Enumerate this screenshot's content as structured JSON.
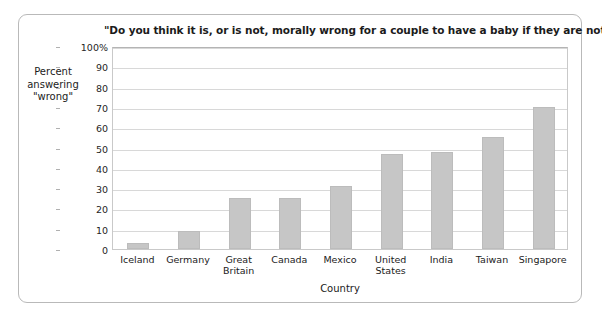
{
  "chart_data": {
    "type": "bar",
    "title": "\"Do you think it is, or is not, morally wrong for a couple to have a baby if they are not married?\"",
    "xlabel": "Country",
    "ylabel": "Percent answering \"wrong\"",
    "ylabel_lines": [
      "Percent",
      "answering",
      "\"wrong\""
    ],
    "categories": [
      "Iceland",
      "Germany",
      "Great Britain",
      "Canada",
      "Mexico",
      "United States",
      "India",
      "Taiwan",
      "Singapore"
    ],
    "category_lines": [
      [
        "Iceland"
      ],
      [
        "Germany"
      ],
      [
        "Great",
        "Britain"
      ],
      [
        "Canada"
      ],
      [
        "Mexico"
      ],
      [
        "United",
        "States"
      ],
      [
        "India"
      ],
      [
        "Taiwan"
      ],
      [
        "Singapore"
      ]
    ],
    "values": [
      3,
      9,
      25,
      25,
      31,
      47,
      48,
      55,
      70
    ],
    "ylim": [
      0,
      100
    ],
    "ytick_values": [
      0,
      10,
      20,
      30,
      40,
      50,
      60,
      70,
      80,
      90,
      100
    ],
    "ytick_labels": [
      "0",
      "10",
      "20",
      "30",
      "40",
      "50",
      "60",
      "70",
      "80",
      "90",
      "100%"
    ],
    "grid": true,
    "legend": "none",
    "bar_color": "#c6c6c6",
    "grid_color": "#d8d8d8",
    "axis_color": "#c9c9c9",
    "text_color": "#1b1b1b"
  }
}
